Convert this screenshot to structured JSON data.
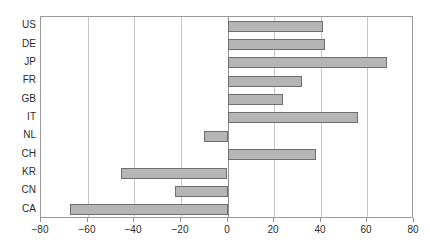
{
  "chart_data": {
    "type": "bar",
    "orientation": "horizontal",
    "title": "",
    "xlabel": "",
    "ylabel": "",
    "categories": [
      "US",
      "DE",
      "JP",
      "FR",
      "GB",
      "IT",
      "NL",
      "CH",
      "KR",
      "CN",
      "CA"
    ],
    "values": [
      41,
      42,
      68.5,
      32,
      24,
      56,
      -10,
      38,
      -45.5,
      -22.5,
      -67.5
    ],
    "series": [
      {
        "name": "",
        "values": [
          41,
          42,
          68.5,
          32,
          24,
          56,
          -10,
          38,
          -45.5,
          -22.5,
          -67.5
        ]
      }
    ],
    "xlim": [
      -80,
      80
    ],
    "xticks": [
      -80,
      -60,
      -40,
      -20,
      0,
      20,
      40,
      60,
      80
    ],
    "xtick_labels": [
      "−80",
      "−60",
      "−40",
      "−20",
      "0",
      "20",
      "40",
      "60",
      "80"
    ],
    "grid": true,
    "gridlines": "vertical",
    "legend": "none",
    "bar_color": "#b5b5b5",
    "bar_border_color": "#6f6f6f",
    "axis_color": "#8f8f8f",
    "grid_color": "#c6c6c6",
    "text_color": "#2b2b2b",
    "background": "#ffffff"
  }
}
